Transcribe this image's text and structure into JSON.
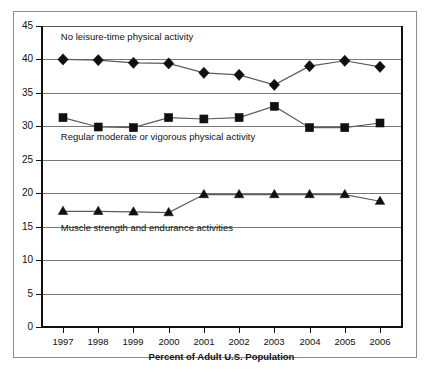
{
  "chart_data": {
    "type": "line",
    "title": "",
    "xlabel": "Percent of Adult U.S. Population",
    "ylabel": "",
    "categories": [
      "1997",
      "1998",
      "1999",
      "2000",
      "2001",
      "2002",
      "2003",
      "2004",
      "2005",
      "2006"
    ],
    "ylim": [
      0,
      45
    ],
    "ytick_labels": [
      "0",
      "5",
      "10",
      "15",
      "20",
      "25",
      "30",
      "35",
      "40",
      "45"
    ],
    "ytick_values": [
      0,
      5,
      10,
      15,
      20,
      25,
      30,
      35,
      40,
      45
    ],
    "grid": true,
    "legend_position": "inline-annotations",
    "series": [
      {
        "name": "No leisure-time physical activity",
        "marker": "diamond",
        "values": [
          40.0,
          39.9,
          39.5,
          39.4,
          38.0,
          37.7,
          36.2,
          39.0,
          39.8,
          38.9
        ]
      },
      {
        "name": "Regular moderate or vigorous physical activity",
        "marker": "square",
        "values": [
          31.3,
          29.9,
          29.8,
          31.3,
          31.1,
          31.3,
          33.0,
          29.8,
          29.8,
          30.5
        ]
      },
      {
        "name": "Muscle strength and endurance activities",
        "marker": "triangle",
        "values": [
          17.3,
          17.3,
          17.2,
          17.1,
          19.8,
          19.8,
          19.8,
          19.8,
          19.8,
          18.8
        ]
      }
    ],
    "annotations": [
      {
        "text": "No leisure-time physical activity",
        "x_frac": 0.055,
        "y_value": 43.3
      },
      {
        "text": "Regular moderate or vigorous physical activity",
        "x_frac": 0.055,
        "y_value": 28.4
      },
      {
        "text": "Muscle strength and endurance activities",
        "x_frac": 0.055,
        "y_value": 14.8
      }
    ]
  },
  "colors": {
    "series_line": "#5b5b5b",
    "marker_fill": "#101010",
    "gridline": "#777777",
    "axis": "#111111",
    "frame": "#8d8d8d",
    "background": "#ffffff"
  }
}
